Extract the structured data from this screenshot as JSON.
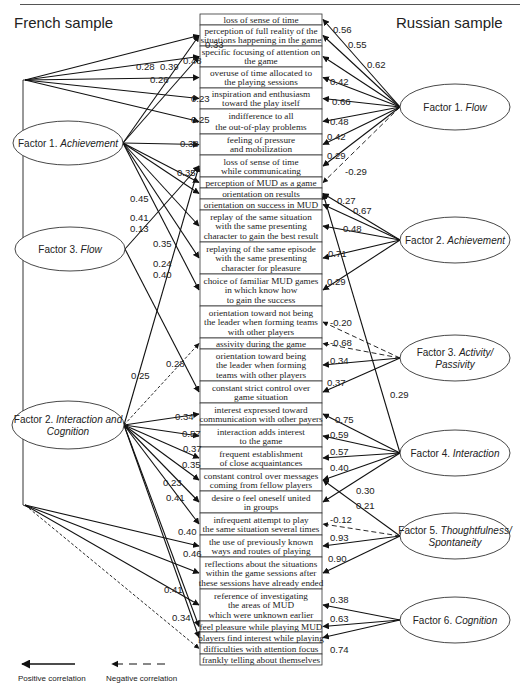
{
  "header": {
    "left_title": "French sample",
    "right_title": "Russian sample"
  },
  "items": [
    {
      "lines": [
        "loss of sense of time"
      ],
      "y": 14,
      "h": 11
    },
    {
      "lines": [
        "perception of full reality of the",
        "situations happening in the game"
      ],
      "y": 25,
      "h": 21
    },
    {
      "lines": [
        "specific focusing of attention on",
        "the game"
      ],
      "y": 46,
      "h": 21
    },
    {
      "lines": [
        "overuse of time allocated to",
        "the playing sessions"
      ],
      "y": 67,
      "h": 21
    },
    {
      "lines": [
        "inspiration and enthusiasm",
        "toward the play itself"
      ],
      "y": 88,
      "h": 21
    },
    {
      "lines": [
        "indifference to all",
        "the out-of-play problems"
      ],
      "y": 109,
      "h": 25
    },
    {
      "lines": [
        "feeling of pressure",
        "and mobilization"
      ],
      "y": 134,
      "h": 21
    },
    {
      "lines": [
        "loss of sense of time",
        "while communicating"
      ],
      "y": 155,
      "h": 22
    },
    {
      "lines": [
        "perception of MUD as a game"
      ],
      "y": 177,
      "h": 11
    },
    {
      "lines": [
        "orientation on results"
      ],
      "y": 188,
      "h": 11
    },
    {
      "lines": [
        "orientation on success in MUD"
      ],
      "y": 199,
      "h": 11
    },
    {
      "lines": [
        "replay of the same situation",
        "with the same presenting",
        "character to gain the best result"
      ],
      "y": 210,
      "h": 32
    },
    {
      "lines": [
        "replaying of the same episode",
        "with the same presenting",
        "character for pleasure"
      ],
      "y": 242,
      "h": 32
    },
    {
      "lines": [
        "choice of familiar MUD games",
        "in which know how",
        "to gain the success"
      ],
      "y": 274,
      "h": 32
    },
    {
      "lines": [
        "orientation toward not being",
        "the leader when forming teams",
        "with other players"
      ],
      "y": 306,
      "h": 32
    },
    {
      "lines": [
        "assivity during the game"
      ],
      "y": 338,
      "h": 11
    },
    {
      "lines": [
        "orientation toward being",
        "the leader when forming",
        "teams with other players"
      ],
      "y": 349,
      "h": 32
    },
    {
      "lines": [
        "constant strict control over",
        "game situation"
      ],
      "y": 381,
      "h": 22
    },
    {
      "lines": [
        "interest expressed toward",
        "communication with other payers"
      ],
      "y": 403,
      "h": 22
    },
    {
      "lines": [
        "interaction adds interest",
        "to the game"
      ],
      "y": 425,
      "h": 22
    },
    {
      "lines": [
        "frequent establishment",
        "of close acquaintances"
      ],
      "y": 447,
      "h": 22
    },
    {
      "lines": [
        "constant control over messages",
        "coming from fellow players"
      ],
      "y": 469,
      "h": 22
    },
    {
      "lines": [
        "desire o feel oneself united",
        "in groups"
      ],
      "y": 491,
      "h": 22
    },
    {
      "lines": [
        "infrequent attempt to play",
        "the same situation several times"
      ],
      "y": 513,
      "h": 22
    },
    {
      "lines": [
        "the use of previously known",
        "ways and routes of playing"
      ],
      "y": 535,
      "h": 22
    },
    {
      "lines": [
        "reflections about the situations",
        "within the game sessions after",
        "these sessions have already ended"
      ],
      "y": 557,
      "h": 32
    },
    {
      "lines": [
        "reference of investigating",
        "the areas of MUD",
        "which were unknown earlier"
      ],
      "y": 589,
      "h": 32
    },
    {
      "lines": [
        "feel pleasure while playing MUD"
      ],
      "y": 621,
      "h": 11
    },
    {
      "lines": [
        "players find interest while playing"
      ],
      "y": 632,
      "h": 11
    },
    {
      "lines": [
        "difficulties with attention focus"
      ],
      "y": 643,
      "h": 11
    },
    {
      "lines": [
        "frankly telling about themselves"
      ],
      "y": 654,
      "h": 11
    }
  ],
  "french_factors": [
    {
      "id": "fA",
      "prefix": "Factor 1.",
      "name": "Achievement",
      "cx": 68,
      "cy": 143,
      "rx": 55,
      "ry": 22
    },
    {
      "id": "fF",
      "prefix": "Factor 3.",
      "name": "Flow",
      "cx": 70,
      "cy": 249,
      "rx": 55,
      "ry": 22
    },
    {
      "id": "fI",
      "prefix": "Factor 2.",
      "name": "Interaction and",
      "name2": "Cognition",
      "cx": 68,
      "cy": 425,
      "rx": 56,
      "ry": 24
    }
  ],
  "russian_factors": [
    {
      "id": "r1",
      "prefix": "Factor 1.",
      "name": "Flow",
      "cx": 455,
      "cy": 107,
      "rx": 55,
      "ry": 23
    },
    {
      "id": "r2",
      "prefix": "Factor 2.",
      "name": "Achievement",
      "cx": 455,
      "cy": 240,
      "rx": 55,
      "ry": 23
    },
    {
      "id": "r3",
      "prefix": "Factor 3.",
      "name": "Activity/",
      "name2": "Passivity",
      "cx": 455,
      "cy": 358,
      "rx": 55,
      "ry": 23
    },
    {
      "id": "r4",
      "prefix": "Factor 4.",
      "name": "Interaction",
      "cx": 455,
      "cy": 453,
      "rx": 55,
      "ry": 23
    },
    {
      "id": "r5",
      "prefix": "Factor 5.",
      "name": "Thoughtfulness/",
      "name2": "Spontaneity",
      "cx": 455,
      "cy": 536,
      "rx": 55,
      "ry": 23
    },
    {
      "id": "r6",
      "prefix": "Factor 6.",
      "name": "Cognition",
      "cx": 455,
      "cy": 620,
      "rx": 55,
      "ry": 23
    }
  ],
  "french_links": [
    {
      "from": "root",
      "to": 1,
      "value": "0.33",
      "lx": 205,
      "ly": 48
    },
    {
      "from": "root",
      "to": 2,
      "value": "0.28",
      "lx": 136,
      "ly": 70
    },
    {
      "from": "root",
      "to": 3,
      "value": "0.26",
      "lx": 150,
      "ly": 83
    },
    {
      "from": "root",
      "to": 4,
      "value": "0.23",
      "lx": 191,
      "ly": 102
    },
    {
      "from": "root",
      "to": 5,
      "value": "0.25",
      "lx": 191,
      "ly": 123
    },
    {
      "from": "fA",
      "to": 1,
      "value": "0.48",
      "lx": 183,
      "ly": 64
    },
    {
      "from": "fA",
      "to": 2,
      "value": "0.39",
      "lx": 160,
      "ly": 70
    },
    {
      "from": "fA",
      "to": 6,
      "value": "0.38",
      "lx": 180,
      "ly": 147
    },
    {
      "from": "fA",
      "to": 8,
      "value": "",
      "lx": 0,
      "ly": 0
    },
    {
      "from": "fA",
      "to": 9,
      "value": "",
      "lx": 0,
      "ly": 0
    },
    {
      "from": "fA",
      "to": 11,
      "value": "",
      "lx": 0,
      "ly": 0
    },
    {
      "from": "fA",
      "to": 12,
      "value": "",
      "lx": 0,
      "ly": 0
    },
    {
      "from": "fA",
      "to": 13,
      "value": "",
      "lx": 0,
      "ly": 0
    },
    {
      "from": "fF",
      "to": 7,
      "value": "0.35",
      "lx": 177,
      "ly": 176
    },
    {
      "from": "fF",
      "to": 17,
      "value": "",
      "lx": 0,
      "ly": 0
    },
    {
      "from": "fI",
      "to": 7,
      "value": "0.25",
      "lx": 131,
      "ly": 379
    },
    {
      "from": "fI",
      "to": 15,
      "value": "0.28",
      "lx": 166,
      "ly": 367,
      "dashed": true
    },
    {
      "from": "fI",
      "to": 18,
      "value": "0.34",
      "lx": 175,
      "ly": 420
    },
    {
      "from": "fI",
      "to": 19,
      "value": "0.57",
      "lx": 182,
      "ly": 437
    },
    {
      "from": "fI",
      "to": 20,
      "value": "0.37",
      "lx": 183,
      "ly": 452
    },
    {
      "from": "fI",
      "to": 21,
      "value": "0.35",
      "lx": 182,
      "ly": 468
    },
    {
      "from": "fI",
      "to": 22,
      "value": "0.23",
      "lx": 163,
      "ly": 486
    },
    {
      "from": "fI",
      "to": 23,
      "value": "0.41",
      "lx": 166,
      "ly": 501
    },
    {
      "from": "fI",
      "to": 27,
      "value": "",
      "lx": 0,
      "ly": 0
    },
    {
      "from": "fI",
      "to": 28,
      "value": "",
      "lx": 0,
      "ly": 0
    },
    {
      "from": "root2",
      "to": 24,
      "value": "0.40",
      "lx": 178,
      "ly": 535
    },
    {
      "from": "root2",
      "to": 25,
      "value": "0.46",
      "lx": 183,
      "ly": 557
    },
    {
      "from": "root2",
      "to": 26,
      "value": "0.41",
      "lx": 164,
      "ly": 593
    },
    {
      "from": "root2",
      "to": 29,
      "value": "0.34",
      "lx": 172,
      "ly": 621,
      "dashed": true
    }
  ],
  "french_free_labels": [
    {
      "value": "0.45",
      "x": 130,
      "y": 202
    },
    {
      "value": "0.41",
      "x": 130,
      "y": 221
    },
    {
      "value": "0.13",
      "x": 130,
      "y": 232
    },
    {
      "value": "0.35",
      "x": 153,
      "y": 247
    },
    {
      "value": "0.24",
      "x": 153,
      "y": 267
    },
    {
      "value": "0.40",
      "x": 153,
      "y": 278
    }
  ],
  "russian_links": [
    {
      "from": "r1",
      "to": 0,
      "value": "0.56",
      "lx": 333,
      "ly": 33
    },
    {
      "from": "r1",
      "to": 1,
      "value": "0.55",
      "lx": 348,
      "ly": 48
    },
    {
      "from": "r1",
      "to": 2,
      "value": "0.62",
      "lx": 367,
      "ly": 68
    },
    {
      "from": "r1",
      "to": 3,
      "value": "0.42",
      "lx": 330,
      "ly": 85
    },
    {
      "from": "r1",
      "to": 4,
      "value": "0.66",
      "lx": 332,
      "ly": 105
    },
    {
      "from": "r1",
      "to": 5,
      "value": "0.48",
      "lx": 330,
      "ly": 125
    },
    {
      "from": "r1",
      "to": 6,
      "value": "0.42",
      "lx": 327,
      "ly": 140
    },
    {
      "from": "r1",
      "to": 7,
      "value": "0.29",
      "lx": 327,
      "ly": 159
    },
    {
      "from": "r1",
      "to": 8,
      "value": "-0.29",
      "lx": 345,
      "ly": 175,
      "dashed": true
    },
    {
      "from": "r2",
      "to": 9,
      "value": "0.27",
      "lx": 337,
      "ly": 204
    },
    {
      "from": "r2",
      "to": 10,
      "value": "0.67",
      "lx": 353,
      "ly": 214
    },
    {
      "from": "r2",
      "to": 11,
      "value": "0.48",
      "lx": 343,
      "ly": 232
    },
    {
      "from": "r2",
      "to": 12,
      "value": "0.71",
      "lx": 328,
      "ly": 257
    },
    {
      "from": "r2",
      "to": 13,
      "value": "0.29",
      "lx": 327,
      "ly": 285
    },
    {
      "from": "r3",
      "to": 14,
      "value": "-0.20",
      "lx": 330,
      "ly": 326,
      "dashed": true
    },
    {
      "from": "r3",
      "to": 15,
      "value": "-0.68",
      "lx": 330,
      "ly": 346,
      "dashed": true
    },
    {
      "from": "r3",
      "to": 16,
      "value": "0.34",
      "lx": 330,
      "ly": 364
    },
    {
      "from": "r3",
      "to": 17,
      "value": "0.37",
      "lx": 327,
      "ly": 386
    },
    {
      "from": "r4",
      "to": 9,
      "value": "0.29",
      "lx": 390,
      "ly": 398
    },
    {
      "from": "r4",
      "to": 18,
      "value": "0.75",
      "lx": 335,
      "ly": 423
    },
    {
      "from": "r4",
      "to": 19,
      "value": "0.59",
      "lx": 330,
      "ly": 438
    },
    {
      "from": "r4",
      "to": 20,
      "value": "0.57",
      "lx": 330,
      "ly": 455
    },
    {
      "from": "r4",
      "to": 21,
      "value": "0.40",
      "lx": 330,
      "ly": 471
    },
    {
      "from": "r4",
      "to": 22,
      "value": "",
      "lx": 0,
      "ly": 0
    },
    {
      "from": "r5",
      "to": 21,
      "value": "0.30",
      "lx": 356,
      "ly": 494
    },
    {
      "from": "r5",
      "to": 23,
      "value": "-0.12",
      "lx": 330,
      "ly": 523,
      "dashed": true
    },
    {
      "from": "r5",
      "to": 24,
      "value": "0.93",
      "lx": 330,
      "ly": 541
    },
    {
      "from": "r5",
      "to": 25,
      "value": "0.90",
      "lx": 328,
      "ly": 562
    },
    {
      "from": "r6",
      "to": 26,
      "value": "0.38",
      "lx": 330,
      "ly": 603
    },
    {
      "from": "r6",
      "to": 27,
      "value": "0.63",
      "lx": 330,
      "ly": 622
    },
    {
      "from": "r6",
      "to": 28,
      "value": "0.74",
      "lx": 330,
      "ly": 653
    }
  ],
  "russian_free_labels": [
    {
      "value": "0.21",
      "x": 356,
      "y": 509
    }
  ],
  "legend": {
    "positive_label": "Positive correlation",
    "negative_label": "Negative correlation"
  }
}
